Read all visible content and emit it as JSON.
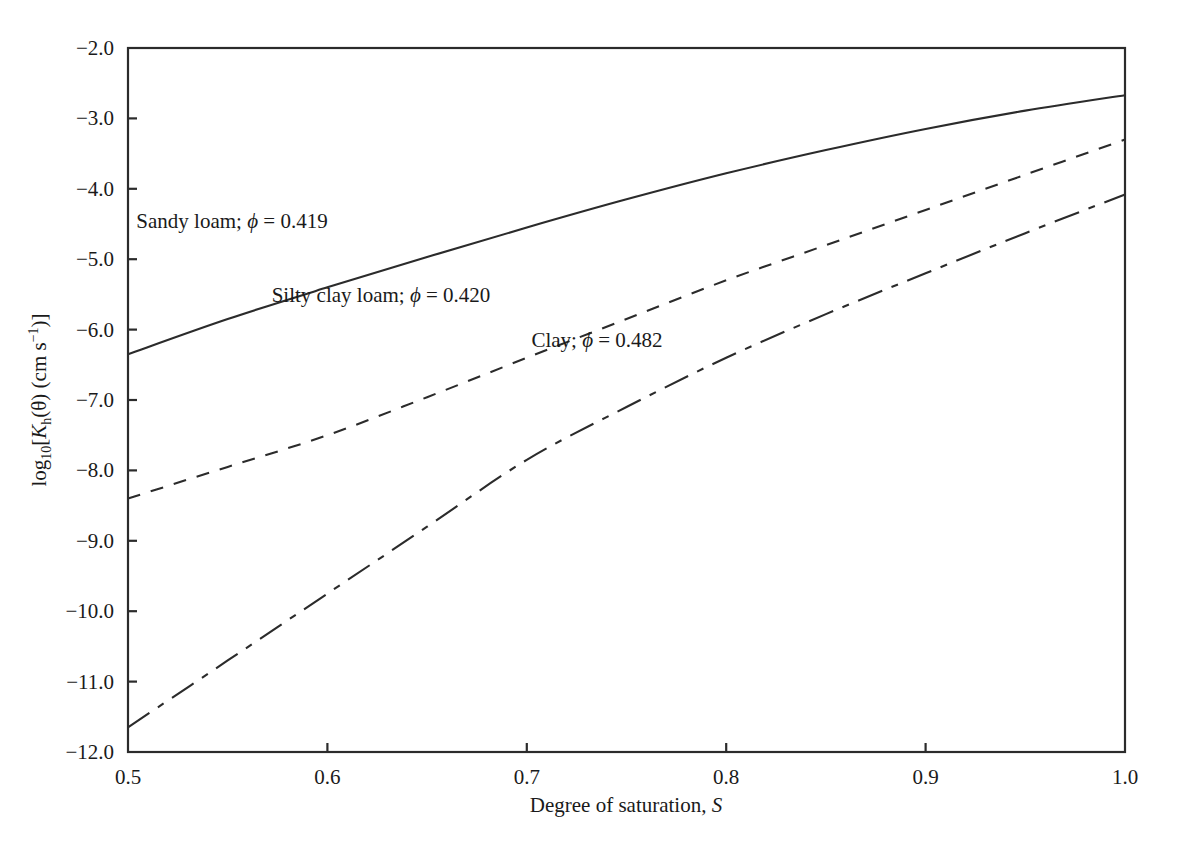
{
  "chart_data": {
    "type": "line",
    "title": "",
    "subtitle": "",
    "xlabel": "Degree of saturation, S",
    "ylabel": "log10[Kh(θ) (cm s-1)]",
    "xlim": [
      0.5,
      1.0
    ],
    "ylim": [
      -12.0,
      -2.0
    ],
    "grid": false,
    "legend_position": "inline-annotations",
    "xticks": [
      "0.5",
      "0.6",
      "0.7",
      "0.8",
      "0.9",
      "1.0"
    ],
    "xtick_values": [
      0.5,
      0.6,
      0.7,
      0.8,
      0.9,
      1.0
    ],
    "yticks": [
      "−2.0",
      "−3.0",
      "−4.0",
      "−5.0",
      "−6.0",
      "−7.0",
      "−8.0",
      "−9.0",
      "−10.0",
      "−11.0",
      "−12.0"
    ],
    "ytick_values": [
      -2.0,
      -3.0,
      -4.0,
      -5.0,
      -6.0,
      -7.0,
      -8.0,
      -9.0,
      -10.0,
      -11.0,
      -12.0
    ],
    "x": [
      0.5,
      0.55,
      0.6,
      0.65,
      0.7,
      0.75,
      0.8,
      0.85,
      0.9,
      0.95,
      1.0
    ],
    "series": [
      {
        "name": "Sandy loam",
        "porosity": 0.419,
        "linestyle": "solid",
        "color": "#2b2b2b",
        "values": [
          -6.35,
          -5.85,
          -5.4,
          -4.97,
          -4.55,
          -4.15,
          -3.78,
          -3.45,
          -3.15,
          -2.89,
          -2.67
        ]
      },
      {
        "name": "Silty clay loam",
        "porosity": 0.42,
        "linestyle": "dashed",
        "color": "#2b2b2b",
        "values": [
          -8.4,
          -7.95,
          -7.5,
          -6.96,
          -6.4,
          -5.85,
          -5.3,
          -4.8,
          -4.3,
          -3.8,
          -3.3
        ]
      },
      {
        "name": "Clay",
        "porosity": 0.482,
        "linestyle": "dash-dot",
        "color": "#2b2b2b",
        "values": [
          -11.65,
          -10.7,
          -9.75,
          -8.8,
          -7.85,
          -7.1,
          -6.4,
          -5.78,
          -5.2,
          -4.63,
          -4.08
        ]
      }
    ]
  },
  "axes": {
    "x_title_prefix": "Degree of saturation, ",
    "x_title_symbol": "S",
    "y_title_log": "log",
    "y_title_log_sub": "10",
    "y_title_open_bracket": "[",
    "y_title_k": "K",
    "y_title_k_sub": "h",
    "y_title_theta": "(θ) (cm s",
    "y_title_sup": "−1",
    "y_title_close": ")]"
  },
  "annotations": [
    {
      "id": "sandy-loam-annotation",
      "text": "Sandy loam; ϕ = 0.419",
      "prefix": "Sandy loam; ",
      "symbol": "ϕ",
      "suffix": " = 0.419",
      "x": 232,
      "y": 228
    },
    {
      "id": "silty-clay-loam-annotation",
      "text": "Silty clay loam; ϕ = 0.420",
      "prefix": "Silty clay loam; ",
      "symbol": "ϕ",
      "suffix": " = 0.420",
      "x": 381,
      "y": 302
    },
    {
      "id": "clay-annotation",
      "text": "Clay; ϕ = 0.482",
      "prefix": "Clay; ",
      "symbol": "ϕ",
      "suffix": " = 0.482",
      "x": 597,
      "y": 347
    }
  ],
  "plot_box": {
    "left": 128,
    "right": 1125,
    "top": 48,
    "bottom": 752,
    "background": "#ffffff",
    "stroke": "#2b2b2b"
  }
}
